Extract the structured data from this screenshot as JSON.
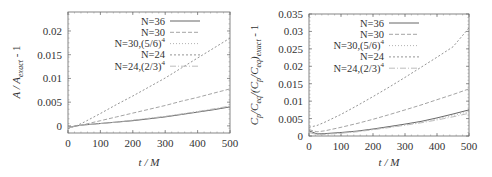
{
  "chart_data": [
    {
      "type": "line",
      "title": "",
      "xlabel": "t / M",
      "ylabel": "A / A_exact - 1",
      "xlim": [
        0,
        500
      ],
      "ylim": [
        -0.0015,
        0.024
      ],
      "xticks": [
        0,
        100,
        200,
        300,
        400,
        500
      ],
      "xtick_labels": [
        "0",
        "100",
        "200",
        "300",
        "400",
        "500"
      ],
      "yticks": [
        0,
        0.005,
        0.01,
        0.015,
        0.02
      ],
      "ytick_labels": [
        "0",
        "0.005",
        "0.01",
        "0.015",
        "0.02"
      ],
      "grid": false,
      "legend_position": "upper left",
      "x": [
        0,
        25,
        50,
        100,
        150,
        200,
        250,
        300,
        350,
        400,
        450,
        500
      ],
      "series": [
        {
          "name": "N=36",
          "values": [
            -0.0003,
            0.0,
            0.0002,
            0.0005,
            0.0008,
            0.0011,
            0.0015,
            0.0019,
            0.0024,
            0.0029,
            0.0034,
            0.004
          ],
          "color": "#555555",
          "dash": ""
        },
        {
          "name": "N=30",
          "values": [
            -0.0004,
            0.0,
            0.0003,
            0.0011,
            0.0019,
            0.0027,
            0.0035,
            0.0043,
            0.0052,
            0.006,
            0.0069,
            0.0078
          ],
          "color": "#9a9a9a",
          "dash": "4,2"
        },
        {
          "name": "N=30,(5/6)^4",
          "values": [
            -0.0003,
            0.0,
            0.0002,
            0.0005,
            0.0008,
            0.0012,
            0.0016,
            0.002,
            0.0025,
            0.003,
            0.0035,
            0.0041
          ],
          "color": "#aaaaaa",
          "dash": "1,2"
        },
        {
          "name": "N=24",
          "values": [
            -0.0006,
            0.0,
            0.0008,
            0.0026,
            0.0045,
            0.0063,
            0.0082,
            0.0101,
            0.0122,
            0.0143,
            0.0164,
            0.0185
          ],
          "color": "#888888",
          "dash": "2,2"
        },
        {
          "name": "N=24,(2/3)^4",
          "values": [
            -0.0004,
            0.0,
            0.0002,
            0.0005,
            0.0008,
            0.0012,
            0.0016,
            0.002,
            0.0025,
            0.003,
            0.0036,
            0.0042
          ],
          "color": "#b5b5b5",
          "dash": "6,2,1,2"
        }
      ]
    },
    {
      "type": "line",
      "title": "",
      "xlabel": "t / M",
      "ylabel": "C_p/C_eq/(C_p/C_eq)_exact - 1",
      "xlim": [
        0,
        500
      ],
      "ylim": [
        0,
        0.035
      ],
      "xticks": [
        0,
        100,
        200,
        300,
        400,
        500
      ],
      "xtick_labels": [
        "0",
        "100",
        "200",
        "300",
        "400",
        "500"
      ],
      "yticks": [
        0,
        0.005,
        0.01,
        0.015,
        0.02,
        0.025,
        0.03,
        0.035
      ],
      "ytick_labels": [
        "0",
        "0.005",
        "0.01",
        "0.015",
        "0.02",
        "0.025",
        "0.03",
        "0.035"
      ],
      "grid": false,
      "legend_position": "upper left",
      "x": [
        0,
        25,
        50,
        100,
        150,
        200,
        250,
        300,
        350,
        400,
        450,
        500
      ],
      "series": [
        {
          "name": "N=36",
          "values": [
            0.0015,
            0.0006,
            0.0007,
            0.001,
            0.0014,
            0.002,
            0.0027,
            0.0034,
            0.0042,
            0.0052,
            0.0063,
            0.0075
          ],
          "color": "#555555",
          "dash": ""
        },
        {
          "name": "N=30",
          "values": [
            0.0018,
            0.0012,
            0.0015,
            0.0025,
            0.0036,
            0.0048,
            0.0061,
            0.0075,
            0.0089,
            0.0104,
            0.0119,
            0.0135
          ],
          "color": "#9a9a9a",
          "dash": "4,2"
        },
        {
          "name": "N=30,(5/6)^4",
          "values": [
            0.0012,
            0.0005,
            0.0006,
            0.0009,
            0.0013,
            0.0019,
            0.0025,
            0.0032,
            0.004,
            0.0049,
            0.0059,
            0.007
          ],
          "color": "#aaaaaa",
          "dash": "1,2"
        },
        {
          "name": "N=24",
          "values": [
            0.0025,
            0.003,
            0.004,
            0.0062,
            0.0087,
            0.0113,
            0.014,
            0.0168,
            0.0197,
            0.0226,
            0.0256,
            0.031
          ],
          "color": "#888888",
          "dash": "2,2"
        },
        {
          "name": "N=24,(2/3)^4",
          "values": [
            0.001,
            0.0004,
            0.0005,
            0.0008,
            0.0012,
            0.0018,
            0.0024,
            0.0031,
            0.0038,
            0.0046,
            0.0055,
            0.0065
          ],
          "color": "#b5b5b5",
          "dash": "6,2,1,2"
        }
      ]
    }
  ],
  "legend": {
    "entries": [
      "N=36",
      "N=30",
      "N=30,(5/6)",
      "N=24",
      "N=24,(2/3)"
    ],
    "superscripts": [
      "",
      "",
      "4",
      "",
      "4"
    ]
  },
  "left_plot": {
    "ylabel_main": "A / A",
    "ylabel_sub": "exact",
    "ylabel_tail": " - 1",
    "xlabel": "t / M"
  },
  "right_plot": {
    "ylabel_parts": [
      "C",
      "p",
      "/C",
      "eq",
      "/(C",
      "p",
      "/C",
      "eq",
      ")",
      "exact",
      " - 1"
    ],
    "xlabel": "t / M"
  }
}
